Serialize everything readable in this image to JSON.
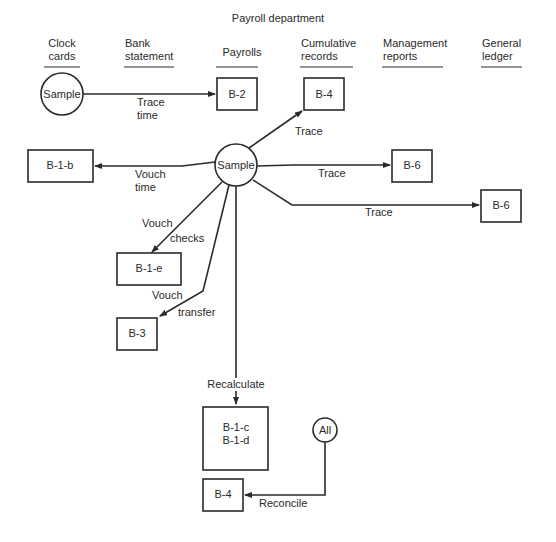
{
  "title": "Payroll department",
  "columns": [
    {
      "line1": "Clock",
      "line2": "cards"
    },
    {
      "line1": "Bank",
      "line2": "statement"
    },
    {
      "line1": "Payrolls",
      "line2": ""
    },
    {
      "line1": "Cumulative",
      "line2": "records"
    },
    {
      "line1": "Management",
      "line2": "reports"
    },
    {
      "line1": "General",
      "line2": "ledger"
    }
  ],
  "nodes": {
    "sample_top": "Sample",
    "sample_center": "Sample",
    "all": "All",
    "b2": "B-2",
    "b4_top": "B-4",
    "b1b": "B-1-b",
    "b6_mid": "B-6",
    "b6_right": "B-6",
    "b1e": "B-1-e",
    "b3": "B-3",
    "b1c": "B-1-c",
    "b1d": "B-1-d",
    "b4_bottom": "B-4"
  },
  "edges": {
    "trace_time": {
      "line1": "Trace",
      "line2": "time"
    },
    "trace_b4": "Trace",
    "trace_b6_mid": "Trace",
    "trace_b6_right": "Trace",
    "vouch_time": {
      "line1": "Vouch",
      "line2": "time"
    },
    "vouch_checks": {
      "line1": "Vouch",
      "line2": "checks"
    },
    "vouch_transfer": {
      "line1": "Vouch",
      "line2": "transfer"
    },
    "recalculate": "Recalculate",
    "reconcile": "Reconcile"
  }
}
